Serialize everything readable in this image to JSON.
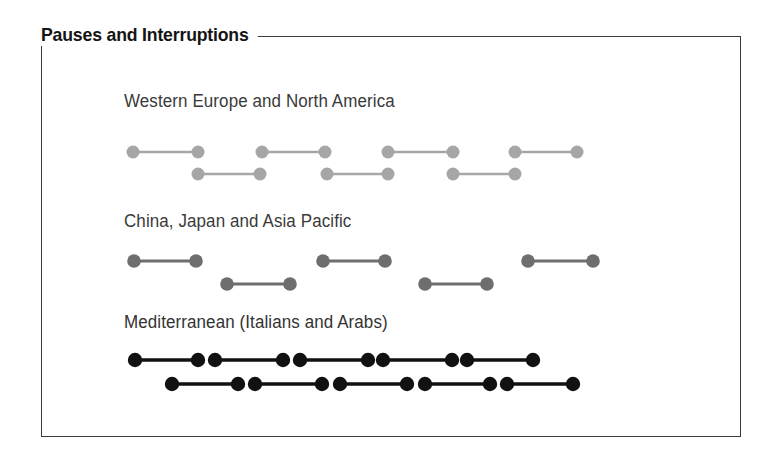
{
  "figure": {
    "title": "Pauses and Interruptions",
    "box": {
      "x": 41,
      "y": 36,
      "width": 700,
      "height": 401,
      "border_color": "#3b3b3b"
    },
    "background": "#ffffff"
  },
  "chart_data": {
    "type": "timeline",
    "title": "Pauses and Interruptions",
    "xlabel": "",
    "ylabel": "",
    "legend": "none",
    "grid": false,
    "groups": [
      {
        "label": "Western Europe and North America",
        "label_x": 124,
        "label_y": 104,
        "color": "#a6a6a6",
        "dot_radius": 6.5,
        "line_width": 2.6,
        "pattern": "turns separated by short pauses",
        "tracks": [
          {
            "name": "speaker-a",
            "y": 152,
            "segments": [
              {
                "start": 133,
                "end": 198
              },
              {
                "start": 262,
                "end": 325
              },
              {
                "start": 388,
                "end": 453
              },
              {
                "start": 515,
                "end": 577
              }
            ]
          },
          {
            "name": "speaker-b",
            "y": 174,
            "segments": [
              {
                "start": 198,
                "end": 260
              },
              {
                "start": 327,
                "end": 388
              },
              {
                "start": 453,
                "end": 515
              }
            ]
          }
        ]
      },
      {
        "label": "China, Japan and Asia Pacific",
        "label_x": 124,
        "label_y": 224,
        "color": "#6e6e6e",
        "dot_radius": 6.8,
        "line_width": 2.8,
        "pattern": "turns separated by long pauses",
        "tracks": [
          {
            "name": "speaker-a",
            "y": 261,
            "segments": [
              {
                "start": 134,
                "end": 196
              },
              {
                "start": 323,
                "end": 385
              },
              {
                "start": 528,
                "end": 593
              }
            ]
          },
          {
            "name": "speaker-b",
            "y": 284,
            "segments": [
              {
                "start": 227,
                "end": 290
              },
              {
                "start": 425,
                "end": 487
              }
            ]
          }
        ]
      },
      {
        "label": "Mediterranean (Italians and Arabs)",
        "label_x": 124,
        "label_y": 325,
        "color": "#111111",
        "dot_radius": 7.2,
        "line_width": 3.4,
        "pattern": "turns overlap with no pauses (interruptions)",
        "tracks": [
          {
            "name": "speaker-a",
            "y": 360,
            "segments": [
              {
                "start": 135,
                "end": 198
              },
              {
                "start": 215,
                "end": 283
              },
              {
                "start": 300,
                "end": 368
              },
              {
                "start": 383,
                "end": 452
              },
              {
                "start": 467,
                "end": 533
              }
            ]
          },
          {
            "name": "speaker-b",
            "y": 384,
            "segments": [
              {
                "start": 172,
                "end": 238
              },
              {
                "start": 255,
                "end": 322
              },
              {
                "start": 340,
                "end": 407
              },
              {
                "start": 425,
                "end": 490
              },
              {
                "start": 507,
                "end": 573
              }
            ]
          }
        ]
      }
    ]
  }
}
